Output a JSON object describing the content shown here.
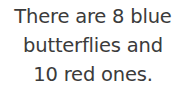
{
  "document": {
    "type": "text-statement",
    "background_color": "#ffffff",
    "text_color": "#3b3b3b",
    "alignment": "center",
    "full_text": "There are 8 blue butterflies and 10 red ones.",
    "lines": [
      "There are 8 blue",
      "butterflies and",
      "10 red ones."
    ],
    "values": {
      "blue_butterflies": "8",
      "red_butterflies": "10"
    }
  }
}
